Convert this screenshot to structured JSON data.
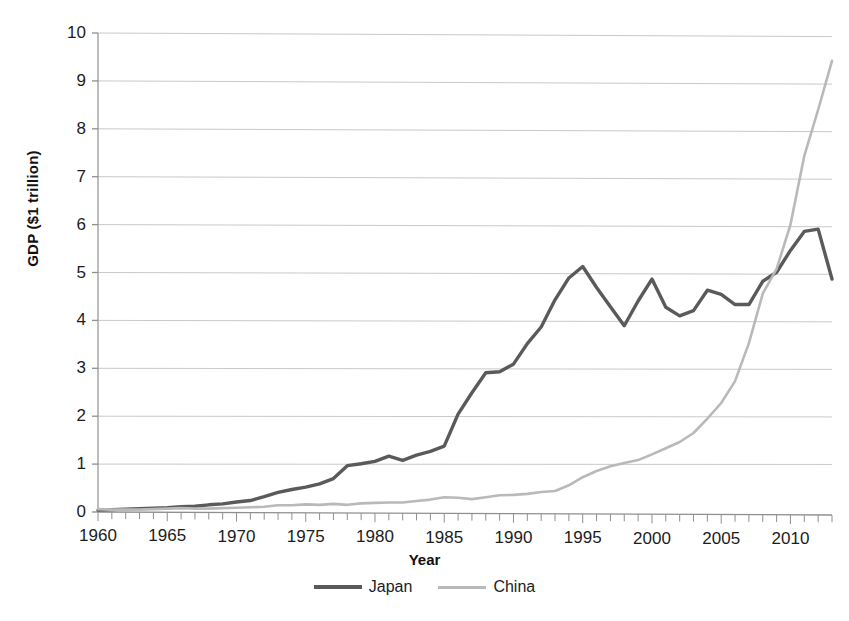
{
  "chart_data": {
    "type": "line",
    "title": "",
    "xlabel": "Year",
    "ylabel": "GDP ($1 trillion)",
    "xlim": [
      1960,
      2013
    ],
    "ylim": [
      0,
      10
    ],
    "ytick_step": 1,
    "xtick_step": 5,
    "minor_xticks": "every 1 year",
    "grid": "horizontal",
    "legend_position": "bottom-center",
    "yticks": [
      "0",
      "1",
      "2",
      "3",
      "4",
      "5",
      "6",
      "7",
      "8",
      "9",
      "10"
    ],
    "xticks": [
      "1960",
      "1965",
      "1970",
      "1975",
      "1980",
      "1985",
      "1990",
      "1995",
      "2000",
      "2005",
      "2010"
    ],
    "colors": {
      "japan": "#5a5a5a",
      "china": "#b9b9b9",
      "grid": "#c9c9c9",
      "axis": "#9a9a9a"
    },
    "x": [
      1960,
      1961,
      1962,
      1963,
      1964,
      1965,
      1966,
      1967,
      1968,
      1969,
      1970,
      1971,
      1972,
      1973,
      1974,
      1975,
      1976,
      1977,
      1978,
      1979,
      1980,
      1981,
      1982,
      1983,
      1984,
      1985,
      1986,
      1987,
      1988,
      1989,
      1990,
      1991,
      1992,
      1993,
      1994,
      1995,
      1996,
      1997,
      1998,
      1999,
      2000,
      2001,
      2002,
      2003,
      2004,
      2005,
      2006,
      2007,
      2008,
      2009,
      2010,
      2011,
      2012,
      2013
    ],
    "series": [
      {
        "name": "Japan",
        "color": "#5a5a5a",
        "values": [
          0.04,
          0.05,
          0.06,
          0.07,
          0.08,
          0.09,
          0.11,
          0.12,
          0.15,
          0.17,
          0.21,
          0.24,
          0.32,
          0.41,
          0.47,
          0.52,
          0.59,
          0.7,
          0.97,
          1.01,
          1.06,
          1.17,
          1.08,
          1.19,
          1.27,
          1.38,
          2.05,
          2.5,
          2.92,
          2.94,
          3.1,
          3.53,
          3.88,
          4.45,
          4.91,
          5.15,
          4.71,
          4.31,
          3.91,
          4.43,
          4.89,
          4.3,
          4.12,
          4.23,
          4.66,
          4.57,
          4.36,
          4.36,
          4.85,
          5.04,
          5.5,
          5.9,
          5.95,
          4.9
        ]
      },
      {
        "name": "China",
        "color": "#b9b9b9",
        "values": [
          0.06,
          0.05,
          0.05,
          0.05,
          0.06,
          0.07,
          0.08,
          0.07,
          0.07,
          0.08,
          0.09,
          0.1,
          0.11,
          0.14,
          0.14,
          0.16,
          0.15,
          0.17,
          0.15,
          0.18,
          0.19,
          0.2,
          0.2,
          0.23,
          0.26,
          0.31,
          0.3,
          0.27,
          0.31,
          0.35,
          0.36,
          0.38,
          0.42,
          0.44,
          0.56,
          0.73,
          0.86,
          0.96,
          1.03,
          1.09,
          1.21,
          1.34,
          1.47,
          1.66,
          1.96,
          2.29,
          2.75,
          3.55,
          4.59,
          5.11,
          6.04,
          7.49,
          8.46,
          9.49
        ]
      }
    ],
    "notes": {
      "japan_peak_1995": 5.15,
      "japan_peak_2012": 5.95,
      "japan_end_2013": 4.9,
      "china_end_2013": 9.49,
      "crossover_year": 2010
    }
  },
  "axes": {
    "ylabel": "GDP ($1 trillion)",
    "xlabel": "Year"
  },
  "legend": {
    "items": [
      {
        "label": "Japan"
      },
      {
        "label": "China"
      }
    ]
  }
}
